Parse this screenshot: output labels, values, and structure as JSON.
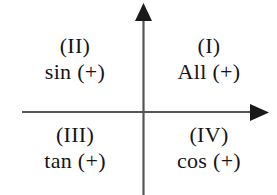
{
  "figure": {
    "background_color": "#ffffff",
    "axis_color": "#555555",
    "text_color": "#151515"
  },
  "axes": {
    "vertical_axis_name": "y-axis",
    "horizontal_axis_name": "x-axis",
    "vertical_arrow_direction": "up",
    "horizontal_arrow_direction": "right",
    "origin_x": 143,
    "origin_y": 112
  },
  "quadrants": [
    {
      "id": "quadrant-1",
      "roman": "(I)",
      "functions": "All (+)",
      "position": "upper-right"
    },
    {
      "id": "quadrant-2",
      "roman": "(II)",
      "functions": "sin (+)",
      "position": "upper-left"
    },
    {
      "id": "quadrant-3",
      "roman": "(III)",
      "functions": "tan (+)",
      "position": "lower-left"
    },
    {
      "id": "quadrant-4",
      "roman": "(IV)",
      "functions": "cos (+)",
      "position": "lower-right"
    }
  ]
}
